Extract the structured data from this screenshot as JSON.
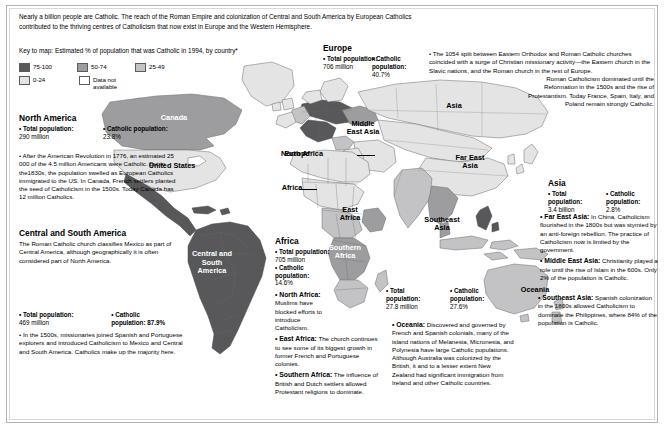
{
  "intro": {
    "paragraph": "Nearly a billion people are Catholic. The reach of the Roman Empire and colonization of Central and South America by European Catholics contributed to the thriving centres of Catholicism that now exist in Europe and the Western Hemisphere.",
    "key_line": "Key to map: Estimated % of population that was Catholic in 1994, by country*"
  },
  "legend": {
    "items": [
      {
        "label": "75-100",
        "color": "#58585a"
      },
      {
        "label": "50-74",
        "color": "#9d9d9f"
      },
      {
        "label": "25-49",
        "color": "#c3c3c5"
      },
      {
        "label": "0-24",
        "color": "#e4e4e5"
      },
      {
        "label": "Data not available",
        "color": "#ffffff"
      }
    ]
  },
  "map_labels": {
    "canada": "Canada",
    "united_states": "United States",
    "central_south_america": "Central and South America",
    "europe": "Europe",
    "africa": "Africa",
    "north_africa": "North Africa",
    "east_africa": "East Africa",
    "southern_africa": "Southern Africa",
    "middle_east_asia": "Middle East Asia",
    "asia": "Asia",
    "far_east_asia": "Far East Asia",
    "southeast_asia": "Southeast Asia",
    "oceania": "Oceania"
  },
  "regions": {
    "north_america": {
      "title": "North America",
      "total_label": "• Total population:",
      "total_value": "290 million",
      "catholic_label": "• Catholic population:",
      "catholic_value": "23.8%",
      "note": "• After the American Revolution in 1776, an estimated 25 000 of the 4.5 million Americans were Catholic. But in the1830s, the population swelled as European Catholics immigrated to the US. In Canada, French settlers  planted the seed of Catholicism in the 1500s. Today Canada has 12 million Catholics."
    },
    "central_south_america": {
      "title": "Central and South America",
      "intro": "The Roman Catholic church classifies Mexico as part of Central America, although geographically it is often considered part of North America.",
      "total_label": "• Total  population:",
      "total_value": "469 million",
      "catholic_label": "• Catholic",
      "catholic_value": "population: 87.9%",
      "note": "• In the 1500s, missionaries joined Spanish and Portuguese explorers and introduced Catholicism to Mexico and Central and South America. Catholics make up the majority here."
    },
    "europe": {
      "title": "Europe",
      "total_label": "• Total population:",
      "total_value": "706 million",
      "catholic_label": "• Catholic population:",
      "catholic_value": "40.7%",
      "note": "• The 1054 split between Eastern Orthodox and Roman Catholic churches coincided with a surge of Christian missionary activity—the Eastern church in the Slavic nations, and the Roman church in the rest of Europe.",
      "note2": "Roman Catholicism dominated until the Reformation  in the 1500s and the rise of Protestantism. Today France, Spain, Italy, and Poland remain strongly Catholic."
    },
    "africa": {
      "title": "Africa",
      "total_label": "• Total population:",
      "total_value": "705 million",
      "catholic_label": "• Catholic population:",
      "catholic_value": "14.6%",
      "north_label": "• North Africa:",
      "north_text": " Muslims have blocked efforts to  introduce Catholicism.",
      "east_label": "• East Africa:",
      "east_text": " The church continues to see some of its biggest growth in former French and Portuguese colonies.",
      "southern_label": "• Southern Africa:",
      "southern_text": "  The influence of British and Dutch settlers allowed Protestant religions to dominate."
    },
    "oceania": {
      "total_label": "• Total population:",
      "total_value": "27.8 million",
      "catholic_label": "• Catholic population:",
      "catholic_value": "27.6%",
      "note_label": "• Oceania:",
      "note_text": " Discovered and governed by French and Spanish colonials, many of the island nations of Melanesia, Micronesia, and Polynesia have large Catholic populations. Although Australia was colonized by the British, it and to a lesser extent New Zealand had significant immigration from Ireland and other Catholic countries."
    },
    "asia": {
      "title": "Asia",
      "total_label": "• Total population:",
      "total_value": "3.4 billion",
      "catholic_label": "• Catholic population:",
      "catholic_value": "2.8%",
      "fareast_label": "• Far East Asia:",
      "fareast_text": " In China, Catholicism flourished in the 1800s but was stymied by an anti-foreign rebellion. The practice of Catholicism now is  limited by the government.",
      "middleeast_label": "• Middle East Asia:",
      "middleeast_text": " Christianity played a role until the rise of Islam in the 600s. Only 2% of the population is Catholic.",
      "southeast_label": "• Southeast Asia:",
      "southeast_text": " Spanish colonization in the 1800s allowed Catholicism to dominate the Philippines, where 84% of the population is Catholic."
    }
  }
}
